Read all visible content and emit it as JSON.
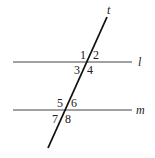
{
  "diagram": {
    "transversal_label": "t",
    "line1_label": "l",
    "line2_label": "m",
    "angles": [
      "1",
      "2",
      "3",
      "4",
      "5",
      "6",
      "7",
      "8"
    ],
    "colors": {
      "line": "#222222",
      "background": "#ffffff"
    }
  }
}
